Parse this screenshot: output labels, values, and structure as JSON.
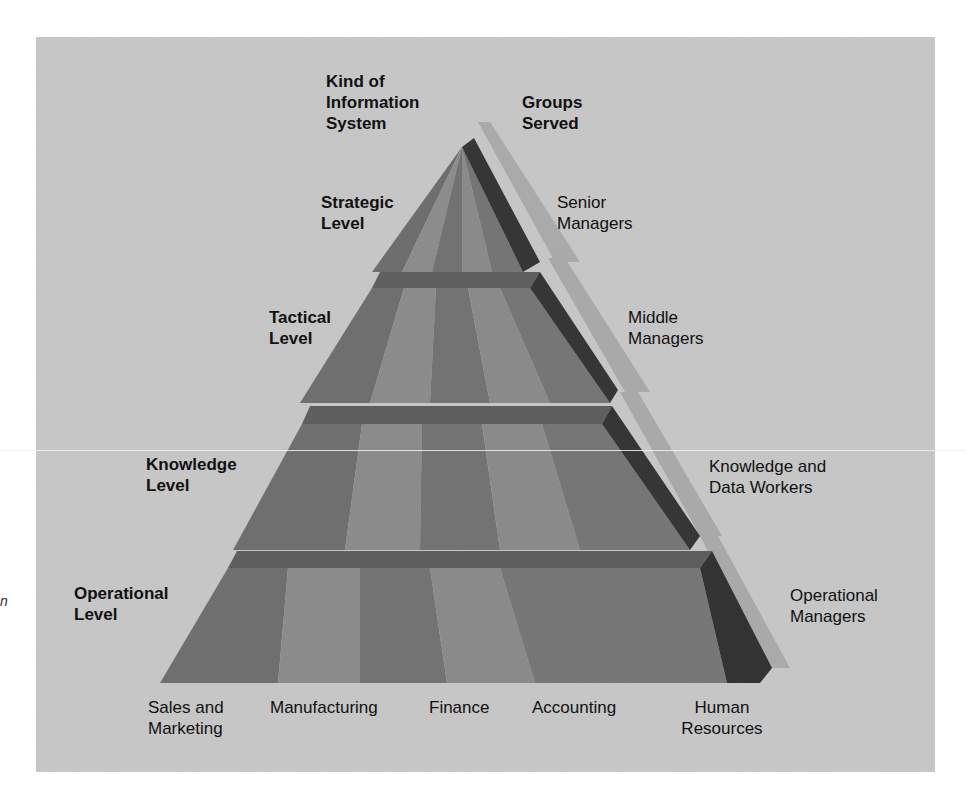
{
  "headers": {
    "left": [
      "Kind of",
      "Information",
      "System"
    ],
    "right": [
      "Groups",
      "Served"
    ]
  },
  "levels": [
    {
      "name": [
        "Strategic",
        "Level"
      ],
      "group": [
        "Senior",
        "Managers"
      ]
    },
    {
      "name": [
        "Tactical",
        "Level"
      ],
      "group": [
        "Middle",
        "Managers"
      ]
    },
    {
      "name": [
        "Knowledge",
        "Level"
      ],
      "group": [
        "Knowledge and",
        "Data Workers"
      ]
    },
    {
      "name": [
        "Operational",
        "Level"
      ],
      "group": [
        "Operational",
        "Managers"
      ]
    }
  ],
  "functional_areas": [
    {
      "label": [
        "Sales and",
        "Marketing"
      ]
    },
    {
      "label": [
        "Manufacturing"
      ]
    },
    {
      "label": [
        "Finance"
      ]
    },
    {
      "label": [
        "Accounting"
      ]
    },
    {
      "label": [
        "Human",
        "Resources"
      ]
    }
  ],
  "stray_glyph": "n",
  "colors": {
    "background_panel": "#c6c6c6",
    "face_dark": "#707070",
    "face_light": "#8a8a8a",
    "band": "#5e5e5e",
    "edge_dark": "#333333",
    "shadow": "#a4a4a4",
    "text": "#111111"
  }
}
